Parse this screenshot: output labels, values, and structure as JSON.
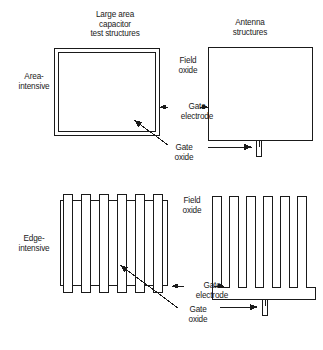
{
  "figure": {
    "caption_titles": {
      "capacitor": "Large area\ncapacitor\ntest structures",
      "antenna": "Antenna\nstructures"
    },
    "row_labels": {
      "area_intensive": "Area-\nintensive",
      "edge_intensive": "Edge-\nintensive"
    },
    "annotations": {
      "field_oxide_top": "Field\noxide",
      "gate_electrode_top": "Gate\nelectrode",
      "gate_oxide_top": "Gate\noxide",
      "field_oxide_bottom": "Field\noxide",
      "gate_electrode_bottom": "Gate\nelectrode",
      "gate_oxide_bottom": "Gate\noxide"
    },
    "colors": {
      "line": "#1a1a1a",
      "background": "#ffffff",
      "text": "#1a1a1a"
    },
    "structures": {
      "area_capacitor": {
        "type": "double-bordered-square",
        "outer": {
          "x": 54,
          "y": 48,
          "w": 106,
          "h": 88
        },
        "inner": {
          "x": 58,
          "y": 52,
          "w": 98,
          "h": 80
        }
      },
      "area_antenna": {
        "type": "square-with-gate-oxide-stub",
        "plate": {
          "x": 208,
          "y": 47,
          "w": 104,
          "h": 93
        },
        "stub": {
          "x": 256,
          "y": 140,
          "w": 5,
          "h": 16
        }
      },
      "edge_comb_left": {
        "type": "comb-over-frame",
        "finger_count": 6,
        "frame": {
          "x": 60,
          "y": 200,
          "w": 108,
          "h": 86
        },
        "fingers": {
          "x": 62,
          "y": 194,
          "w": 9,
          "h": 98,
          "pitch": 17.6
        }
      },
      "edge_comb_right": {
        "type": "comb-with-gate-oxide-stub",
        "finger_count": 6,
        "body": {
          "x": 212,
          "y": 196,
          "w": 104,
          "h": 104
        },
        "stub": {
          "x": 262,
          "y": 300,
          "w": 5,
          "h": 16
        }
      }
    }
  }
}
